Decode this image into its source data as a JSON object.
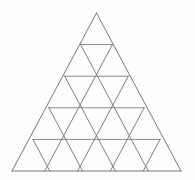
{
  "figure": {
    "name": "subdivided-equilateral-triangle",
    "canvas": {
      "width": 195,
      "height": 180,
      "background_color": "#fdfdfd"
    },
    "style": {
      "line_color": "#808080",
      "horizontal_line_color": "#8a8a8a",
      "outline_color": "#787878",
      "line_width": 1
    },
    "geometry": {
      "apex": {
        "x": 96.5,
        "y": 13
      },
      "base_left": {
        "x": 12,
        "y": 171
      },
      "base_right": {
        "x": 181,
        "y": 171
      },
      "rows": 5,
      "row_y": [
        13,
        44.6,
        76.2,
        107.8,
        139.4,
        171
      ],
      "small_triangles_total": 25,
      "upward_triangles": 15,
      "downward_triangles": 10,
      "side_length": 169,
      "row_height": 31.6,
      "vertices_per_row": [
        1,
        2,
        3,
        4,
        5,
        6
      ]
    },
    "lines": {
      "horizontal": [
        {
          "row": 1,
          "y": 44.6,
          "x1": 80.6,
          "x2": 112.4
        },
        {
          "row": 2,
          "y": 76.2,
          "x1": 64.7,
          "x2": 128.3
        },
        {
          "row": 3,
          "y": 107.8,
          "x1": 48.8,
          "x2": 144.2
        },
        {
          "row": 4,
          "y": 139.4,
          "x1": 32.9,
          "x2": 160.1
        },
        {
          "row": 5,
          "y": 171,
          "x1": 12,
          "x2": 181
        }
      ],
      "left_leaning": [
        {
          "index": 1,
          "x1": 96.5,
          "y1": 13,
          "x2": 12,
          "y2": 171
        },
        {
          "index": 2,
          "x1": 112.4,
          "y1": 44.6,
          "x2": 44.8,
          "y2": 171
        },
        {
          "index": 3,
          "x1": 128.3,
          "y1": 76.2,
          "x2": 77.6,
          "y2": 171
        },
        {
          "index": 4,
          "x1": 144.2,
          "y1": 107.8,
          "x2": 110.4,
          "y2": 171
        },
        {
          "index": 5,
          "x1": 160.1,
          "y1": 139.4,
          "x2": 143.2,
          "y2": 171
        }
      ],
      "right_leaning": [
        {
          "index": 1,
          "x1": 96.5,
          "y1": 13,
          "x2": 181,
          "y2": 171
        },
        {
          "index": 2,
          "x1": 80.6,
          "y1": 44.6,
          "x2": 148.2,
          "y2": 171
        },
        {
          "index": 3,
          "x1": 64.7,
          "y1": 76.2,
          "x2": 115.4,
          "y2": 171
        },
        {
          "index": 4,
          "x1": 48.8,
          "y1": 107.8,
          "x2": 82.6,
          "y2": 171
        },
        {
          "index": 5,
          "x1": 32.9,
          "y1": 139.4,
          "x2": 49.8,
          "y2": 171
        }
      ]
    }
  }
}
